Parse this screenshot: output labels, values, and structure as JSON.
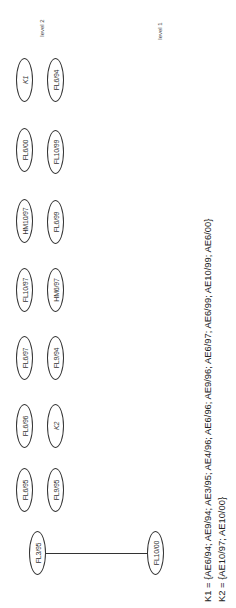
{
  "levels": {
    "level2": "level 2",
    "level1": "level 1"
  },
  "nodes": {
    "top_row": [
      {
        "label": "K1",
        "italic": true
      },
      {
        "label": "FL6/00"
      },
      {
        "label": "HM10/97"
      },
      {
        "label": "FL10/97"
      },
      {
        "label": "FL6/97"
      },
      {
        "label": "FL6/96"
      },
      {
        "label": "FL6/95"
      }
    ],
    "bottom_row": [
      {
        "label": "FL6/94"
      },
      {
        "label": "FL10/99"
      },
      {
        "label": "FL6/99"
      },
      {
        "label": "HM6/97"
      },
      {
        "label": "FL9/94"
      },
      {
        "label": "K2",
        "italic": true
      },
      {
        "label": "FL9/95"
      }
    ],
    "edge_pair": [
      {
        "label": "FL3/95"
      },
      {
        "label": "FL10/00"
      }
    ]
  },
  "legend": {
    "k1": "K1 = {AE6/94; AE9/94; AE3/95; AE4/96; AE6/96; AE9/96; AE6/97; AE6/99; AE10/99; AE6/00}",
    "k2": "K2 = {AE10/97; AE10/00}"
  }
}
